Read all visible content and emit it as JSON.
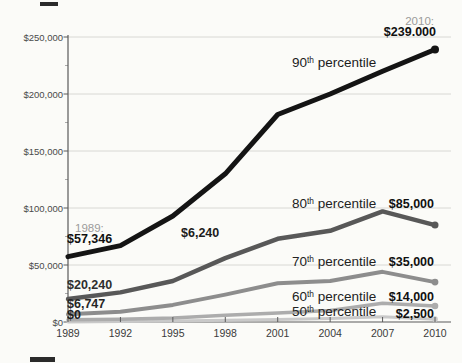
{
  "chart_data": {
    "type": "line",
    "title": "",
    "xlabel": "",
    "ylabel": "",
    "x": [
      1989,
      1992,
      1995,
      1998,
      2001,
      2004,
      2007,
      2010
    ],
    "x_tick_labels": [
      "1989",
      "1992",
      "1995",
      "1998",
      "2001",
      "2004",
      "2007",
      "2010"
    ],
    "y_ticks": [
      0,
      50000,
      100000,
      150000,
      200000,
      250000
    ],
    "y_tick_labels": [
      "$0",
      "$50,000",
      "$100,000",
      "$150,000",
      "$200,000",
      "$250,000"
    ],
    "y_minor_ticks": [
      25000,
      75000,
      125000,
      175000,
      225000
    ],
    "ylim": [
      0,
      250000
    ],
    "grid": "horizontal",
    "legend_position": "inline-labels",
    "series": [
      {
        "name": "50th percentile",
        "color": "#c9c9c9",
        "width": 3,
        "dot_r": 2.8,
        "values": [
          0,
          400,
          800,
          1500,
          2200,
          3000,
          4500,
          2500
        ]
      },
      {
        "name": "60th percentile",
        "color": "#acacac",
        "width": 3.5,
        "dot_r": 3.3,
        "values": [
          2000,
          2500,
          3500,
          6000,
          8000,
          10000,
          16500,
          14000
        ]
      },
      {
        "name": "70th percentile",
        "color": "#8d8d8d",
        "width": 4,
        "dot_r": 3.4,
        "values": [
          6747,
          9000,
          15000,
          24000,
          34000,
          36000,
          44000,
          35000
        ]
      },
      {
        "name": "80th percentile",
        "color": "#585858",
        "width": 4.5,
        "dot_r": 3.5,
        "values": [
          20240,
          26000,
          36000,
          56000,
          73000,
          80000,
          97000,
          85000
        ]
      },
      {
        "name": "90th percentile",
        "color": "#141414",
        "width": 5,
        "dot_r": 4,
        "values": [
          57346,
          67000,
          93000,
          130000,
          182000,
          200000,
          220000,
          239000
        ]
      }
    ],
    "annotations": [
      {
        "id": "year-label-2010",
        "text": "2010:",
        "x": 434,
        "y": 15,
        "align": "right",
        "size": 11.5,
        "weight": 400,
        "color": "#9b9b9b"
      },
      {
        "id": "value-90th-2010",
        "text": "$239.000",
        "x": 436,
        "y": 26,
        "align": "right",
        "size": 12.5,
        "weight": 700,
        "color": "#101010"
      },
      {
        "id": "series-label-90th",
        "num": "90",
        "sup": "th",
        "rest": " percentile",
        "x": 292,
        "y": 56,
        "align": "left",
        "size": 13.5,
        "weight": 400,
        "color": "#1c1c1c"
      },
      {
        "id": "year-label-1989",
        "text": "1989:",
        "x": 75,
        "y": 222,
        "align": "left",
        "size": 11.5,
        "weight": 400,
        "color": "#9b9b9b"
      },
      {
        "id": "value-90th-1989",
        "text": "$57,346",
        "x": 67,
        "y": 233,
        "align": "left",
        "size": 12.5,
        "weight": 700,
        "color": "#101010"
      },
      {
        "id": "value-mid-6240",
        "text": "$6,240",
        "x": 181,
        "y": 227,
        "align": "left",
        "size": 12.5,
        "weight": 700,
        "color": "#1c1c1c"
      },
      {
        "id": "value-80th-1989",
        "text": "$20,240",
        "x": 67,
        "y": 279,
        "align": "left",
        "size": 12.5,
        "weight": 700,
        "color": "#2e2e2e"
      },
      {
        "id": "value-70th-1989",
        "text": "$6,747",
        "x": 67,
        "y": 298,
        "align": "left",
        "size": 12.5,
        "weight": 700,
        "color": "#262626"
      },
      {
        "id": "value-50th-1989",
        "text": "$0",
        "x": 67,
        "y": 309,
        "align": "left",
        "size": 12.5,
        "weight": 700,
        "color": "#1c1c1c"
      },
      {
        "id": "series-label-80th",
        "num": "80",
        "sup": "th",
        "rest": " percentile",
        "x": 292,
        "y": 197,
        "align": "left",
        "size": 13.5,
        "weight": 400,
        "color": "#222222"
      },
      {
        "id": "value-80th-2010",
        "text": "$85,000",
        "x": 434,
        "y": 198,
        "align": "right",
        "size": 12.5,
        "weight": 700,
        "color": "#101010"
      },
      {
        "id": "series-label-70th",
        "num": "70",
        "sup": "th",
        "rest": " percentile",
        "x": 292,
        "y": 255,
        "align": "left",
        "size": 13.5,
        "weight": 400,
        "color": "#222222"
      },
      {
        "id": "value-70th-2010",
        "text": "$35,000",
        "x": 434,
        "y": 256,
        "align": "right",
        "size": 12.5,
        "weight": 700,
        "color": "#101010"
      },
      {
        "id": "series-label-60th",
        "num": "60",
        "sup": "th",
        "rest": " percentile",
        "x": 292,
        "y": 290,
        "align": "left",
        "size": 13.5,
        "weight": 400,
        "color": "#222222"
      },
      {
        "id": "value-60th-2010",
        "text": "$14,000",
        "x": 434,
        "y": 291,
        "align": "right",
        "size": 12.5,
        "weight": 700,
        "color": "#101010"
      },
      {
        "id": "series-label-50th",
        "num": "50",
        "sup": "th",
        "rest": " percentile",
        "x": 292,
        "y": 305,
        "align": "left",
        "size": 13.5,
        "weight": 400,
        "color": "#222222"
      },
      {
        "id": "value-50th-2010",
        "text": "$2,500",
        "x": 434,
        "y": 308,
        "align": "right",
        "size": 12.5,
        "weight": 700,
        "color": "#101010"
      }
    ],
    "colors": {
      "background": "#fbfbf8",
      "gridline": "#d8d8d4",
      "axis": "#5a5a5a",
      "minor_tick": "#aaaaaa"
    }
  }
}
